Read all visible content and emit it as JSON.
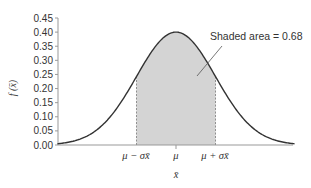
{
  "chart_data": {
    "type": "area",
    "title": "",
    "subtitle": "",
    "distribution": "normal",
    "xlabel": "x̄",
    "ylabel": "f (x̄)",
    "ylim": [
      0,
      0.45
    ],
    "yticks": [
      "0.00",
      "0.05",
      "0.10",
      "0.15",
      "0.20",
      "0.25",
      "0.30",
      "0.35",
      "0.40",
      "0.45"
    ],
    "xticks": [
      {
        "label": "μ − σx̄",
        "position": -1
      },
      {
        "label": "μ",
        "position": 0
      },
      {
        "label": "μ + σx̄",
        "position": 1
      }
    ],
    "xrange_sd": [
      -3.0,
      3.0
    ],
    "peak": 0.4,
    "shaded_region": {
      "from": -1,
      "to": 1,
      "area": 0.68
    },
    "annotation": "Shaded area = 0.68",
    "grid": false,
    "colors": {
      "curve": "#333333",
      "shade": "#d4d4d4",
      "axis": "#888888",
      "dashed": "#777777"
    }
  }
}
